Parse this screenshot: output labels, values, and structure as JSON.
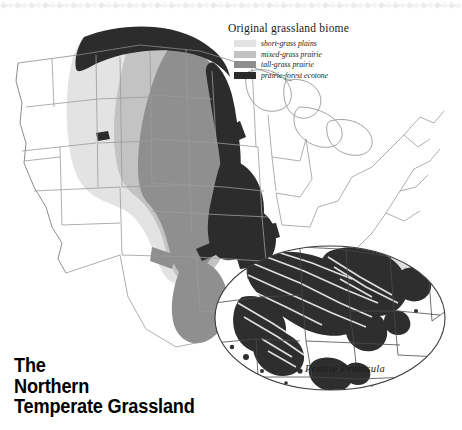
{
  "figure": {
    "title_lines": [
      "The",
      "Northern",
      "Temperate Grassland"
    ],
    "inset_caption": "Prairie Peninsula"
  },
  "legend": {
    "title": "Original grassland biome",
    "items": [
      {
        "label": "short-grass plains",
        "color": "#e2e2e2"
      },
      {
        "label": "mixed-grass prairie",
        "color": "#c2c2c2"
      },
      {
        "label": "tall-grass prairie",
        "color": "#8e8e8e"
      },
      {
        "label": "prairie-forest ecotone",
        "color": "#2b2b2b"
      }
    ]
  },
  "map_data": {
    "type": "choropleth-map",
    "region": "United States (conterminous)",
    "projection": "albers-like",
    "palette": {
      "land": "#ffffff",
      "border": "#9a9a9a",
      "coast": "#6e6e6e",
      "short_grass": "#e2e2e2",
      "mixed_grass": "#c2c2c2",
      "tall_grass": "#8e8e8e",
      "ecotone": "#2b2b2b",
      "lake": "#ffffff",
      "inset_outline": "#3a3a3a"
    },
    "bands": [
      {
        "name": "short-grass plains",
        "states": [
          "MT",
          "WY",
          "CO",
          "NM",
          "TX",
          "NE",
          "KS",
          "OK",
          "ND",
          "SD"
        ]
      },
      {
        "name": "mixed-grass prairie",
        "states": [
          "ND",
          "SD",
          "NE",
          "KS",
          "OK",
          "TX"
        ]
      },
      {
        "name": "tall-grass prairie",
        "states": [
          "MN",
          "IA",
          "MO",
          "IL",
          "KS",
          "OK",
          "TX"
        ]
      },
      {
        "name": "prairie-forest ecotone",
        "states": [
          "MB",
          "MN",
          "WI",
          "IA",
          "IL",
          "IN",
          "MO"
        ]
      }
    ],
    "inset": {
      "label": "Prairie Peninsula",
      "focus_states": [
        "IL",
        "IN",
        "IA",
        "MO",
        "OH",
        "WI",
        "MI",
        "KY"
      ]
    }
  }
}
